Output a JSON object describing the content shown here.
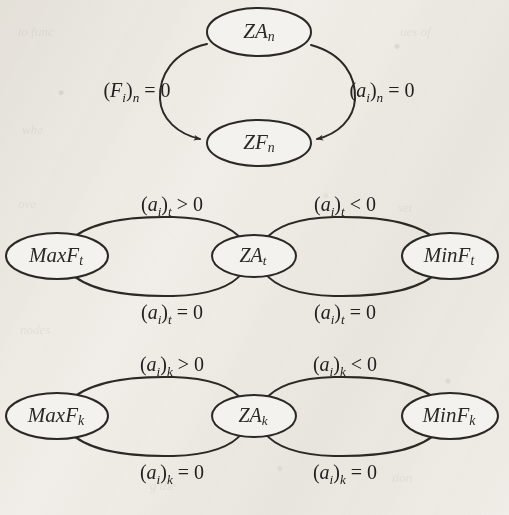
{
  "figure": {
    "kind": "state-transition-diagram",
    "background_color": "#f3f1ed",
    "stroke_color": "#2b2926",
    "text_color": "#232120"
  },
  "groups": [
    {
      "id": "group-n",
      "layout": "vertical-cycle",
      "nodes": [
        {
          "id": "node-za-n",
          "base": "ZA",
          "subscript": "n",
          "role": "zero-acceleration"
        },
        {
          "id": "node-zf-n",
          "base": "ZF",
          "subscript": "n",
          "role": "zero-force"
        }
      ],
      "edges": [
        {
          "id": "edge-n-left",
          "from": "node-za-n",
          "to": "node-zf-n",
          "side": "left",
          "label": {
            "paren_base": "F",
            "paren_sub": "i",
            "outer_sub": "n",
            "relation": "=",
            "value": "0"
          }
        },
        {
          "id": "edge-n-right",
          "from": "node-za-n",
          "to": "node-zf-n",
          "side": "right",
          "label": {
            "paren_base": "a",
            "paren_sub": "i",
            "outer_sub": "n",
            "relation": "=",
            "value": "0"
          }
        }
      ]
    },
    {
      "id": "group-t",
      "layout": "horizontal-triple",
      "nodes": [
        {
          "id": "node-maxf-t",
          "base": "MaxF",
          "subscript": "t",
          "role": "maximum-force"
        },
        {
          "id": "node-za-t",
          "base": "ZA",
          "subscript": "t",
          "role": "zero-acceleration"
        },
        {
          "id": "node-minf-t",
          "base": "MinF",
          "subscript": "t",
          "role": "minimum-force"
        }
      ],
      "edges": [
        {
          "id": "edge-t-left-top",
          "from": "node-maxf-t",
          "to": "node-za-t",
          "side": "top",
          "label": {
            "paren_base": "a",
            "paren_sub": "i",
            "outer_sub": "t",
            "relation": ">",
            "value": "0"
          }
        },
        {
          "id": "edge-t-left-bottom",
          "from": "node-za-t",
          "to": "node-maxf-t",
          "side": "bottom",
          "label": {
            "paren_base": "a",
            "paren_sub": "i",
            "outer_sub": "t",
            "relation": "=",
            "value": "0"
          }
        },
        {
          "id": "edge-t-right-top",
          "from": "node-minf-t",
          "to": "node-za-t",
          "side": "top",
          "label": {
            "paren_base": "a",
            "paren_sub": "i",
            "outer_sub": "t",
            "relation": "<",
            "value": "0"
          }
        },
        {
          "id": "edge-t-right-bottom",
          "from": "node-za-t",
          "to": "node-minf-t",
          "side": "bottom",
          "label": {
            "paren_base": "a",
            "paren_sub": "i",
            "outer_sub": "t",
            "relation": "=",
            "value": "0"
          }
        }
      ]
    },
    {
      "id": "group-k",
      "layout": "horizontal-triple",
      "nodes": [
        {
          "id": "node-maxf-k",
          "base": "MaxF",
          "subscript": "k",
          "role": "maximum-force"
        },
        {
          "id": "node-za-k",
          "base": "ZA",
          "subscript": "k",
          "role": "zero-acceleration"
        },
        {
          "id": "node-minf-k",
          "base": "MinF",
          "subscript": "k",
          "role": "minimum-force"
        }
      ],
      "edges": [
        {
          "id": "edge-k-left-top",
          "from": "node-maxf-k",
          "to": "node-za-k",
          "side": "top",
          "label": {
            "paren_base": "a",
            "paren_sub": "i",
            "outer_sub": "k",
            "relation": ">",
            "value": "0"
          }
        },
        {
          "id": "edge-k-left-bottom",
          "from": "node-za-k",
          "to": "node-maxf-k",
          "side": "bottom",
          "label": {
            "paren_base": "a",
            "paren_sub": "i",
            "outer_sub": "k",
            "relation": "=",
            "value": "0"
          }
        },
        {
          "id": "edge-k-right-top",
          "from": "node-minf-k",
          "to": "node-za-k",
          "side": "top",
          "label": {
            "paren_base": "a",
            "paren_sub": "i",
            "outer_sub": "k",
            "relation": "<",
            "value": "0"
          }
        },
        {
          "id": "edge-k-right-bottom",
          "from": "node-za-k",
          "to": "node-minf-k",
          "side": "bottom",
          "label": {
            "paren_base": "a",
            "paren_sub": "i",
            "outer_sub": "k",
            "relation": "=",
            "value": "0"
          }
        }
      ]
    }
  ],
  "nodes_text": {
    "za_n_base": "ZA",
    "za_n_sub": "n",
    "zf_n_base": "ZF",
    "zf_n_sub": "n",
    "maxf_t_base": "MaxF",
    "maxf_t_sub": "t",
    "za_t_base": "ZA",
    "za_t_sub": "t",
    "minf_t_base": "MinF",
    "minf_t_sub": "t",
    "maxf_k_base": "MaxF",
    "maxf_k_sub": "k",
    "za_k_base": "ZA",
    "za_k_sub": "k",
    "minf_k_base": "MinF",
    "minf_k_sub": "k"
  },
  "labels_text": {
    "n_left": {
      "open": "(",
      "base": "F",
      "sub": "i",
      "close": ")",
      "outer": "n",
      "tail": " = 0"
    },
    "n_right": {
      "open": "(",
      "base": "a",
      "sub": "i",
      "close": ")",
      "outer": "n",
      "tail": " = 0"
    },
    "t_top_left": {
      "open": "(",
      "base": "a",
      "sub": "i",
      "close": ")",
      "outer": "t",
      "tail": " > 0"
    },
    "t_top_right": {
      "open": "(",
      "base": "a",
      "sub": "i",
      "close": ")",
      "outer": "t",
      "tail": " < 0"
    },
    "t_bottom_left": {
      "open": "(",
      "base": "a",
      "sub": "i",
      "close": ")",
      "outer": "t",
      "tail": " = 0"
    },
    "t_bottom_right": {
      "open": "(",
      "base": "a",
      "sub": "i",
      "close": ")",
      "outer": "t",
      "tail": " = 0"
    },
    "k_top_left": {
      "open": "(",
      "base": "a",
      "sub": "i",
      "close": ")",
      "outer": "k",
      "tail": " > 0"
    },
    "k_top_right": {
      "open": "(",
      "base": "a",
      "sub": "i",
      "close": ")",
      "outer": "k",
      "tail": " < 0"
    },
    "k_bottom_left": {
      "open": "(",
      "base": "a",
      "sub": "i",
      "close": ")",
      "outer": "k",
      "tail": " = 0"
    },
    "k_bottom_right": {
      "open": "(",
      "base": "a",
      "sub": "i",
      "close": ")",
      "outer": "k",
      "tail": " = 0"
    }
  }
}
